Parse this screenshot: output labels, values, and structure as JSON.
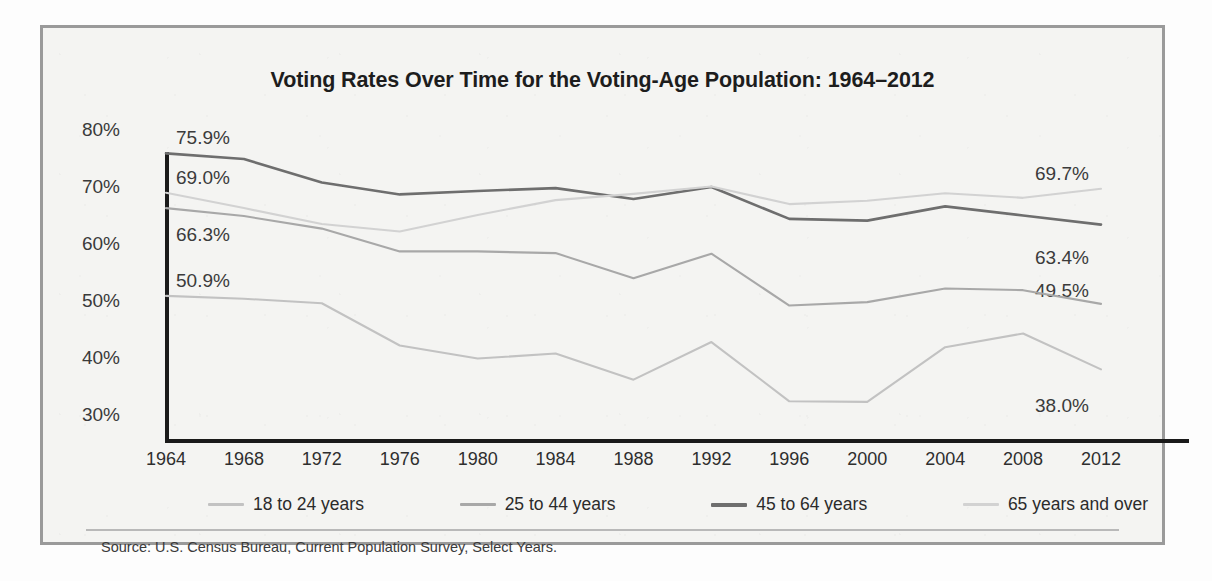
{
  "figure": {
    "title": "Voting Rates Over Time for the Voting-Age Population: 1964–2012",
    "source": "Source: U.S. Census Bureau, Current Population Survey, Select Years."
  },
  "legend": {
    "items": [
      {
        "label": "18 to 24 years",
        "color": "#c2c2c2"
      },
      {
        "label": "25 to 44 years",
        "color": "#a8a8a8"
      },
      {
        "label": "45 to 64 years",
        "color": "#6e6e6e"
      },
      {
        "label": "65 years and over",
        "color": "#d2d2d2"
      }
    ]
  },
  "annotations": {
    "left": [
      {
        "text": "75.9%",
        "series": "45 to 64 years"
      },
      {
        "text": "69.0%",
        "series": "65 years and over"
      },
      {
        "text": "66.3%",
        "series": "25 to 44 years"
      },
      {
        "text": "50.9%",
        "series": "18 to 24 years"
      }
    ],
    "right": [
      {
        "text": "69.7%",
        "series": "65 years and over"
      },
      {
        "text": "63.4%",
        "series": "45 to 64 years"
      },
      {
        "text": "49.5%",
        "series": "25 to 44 years"
      },
      {
        "text": "38.0%",
        "series": "18 to 24 years"
      }
    ]
  },
  "chart_data": {
    "type": "line",
    "title": "Voting Rates Over Time for the Voting-Age Population: 1964–2012",
    "xlabel": "",
    "ylabel": "",
    "ylim": [
      30,
      80
    ],
    "ytick_labels": [
      "80%",
      "70%",
      "60%",
      "50%",
      "40%",
      "30%"
    ],
    "ytick_values": [
      80,
      70,
      60,
      50,
      40,
      30
    ],
    "grid": false,
    "legend_position": "bottom",
    "categories": [
      1964,
      1968,
      1972,
      1976,
      1980,
      1984,
      1988,
      1992,
      1996,
      2000,
      2004,
      2008,
      2012
    ],
    "series": [
      {
        "name": "18 to 24 years",
        "color": "#c2c2c2",
        "values": [
          50.9,
          50.4,
          49.6,
          42.2,
          39.9,
          40.8,
          36.2,
          42.8,
          32.4,
          32.3,
          41.9,
          44.3,
          38.0
        ]
      },
      {
        "name": "25 to 44 years",
        "color": "#a8a8a8",
        "values": [
          66.3,
          64.9,
          62.7,
          58.7,
          58.7,
          58.4,
          54.0,
          58.3,
          49.2,
          49.8,
          52.2,
          51.9,
          49.5
        ]
      },
      {
        "name": "45 to 64 years",
        "color": "#6e6e6e",
        "values": [
          75.9,
          74.9,
          70.8,
          68.7,
          69.3,
          69.8,
          67.9,
          70.0,
          64.4,
          64.1,
          66.6,
          65.0,
          63.4
        ]
      },
      {
        "name": "65 years and over",
        "color": "#d2d2d2",
        "values": [
          69.0,
          66.3,
          63.5,
          62.2,
          65.1,
          67.7,
          68.8,
          70.1,
          67.0,
          67.6,
          68.9,
          68.1,
          69.7
        ]
      }
    ]
  }
}
